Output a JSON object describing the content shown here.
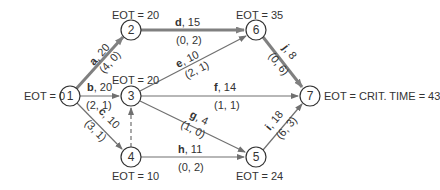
{
  "nodes": [
    {
      "id": "1",
      "eot_label": "EOT = 0"
    },
    {
      "id": "2",
      "eot_label": "EOT = 20"
    },
    {
      "id": "3",
      "eot_label": "EOT = 20"
    },
    {
      "id": "4",
      "eot_label": "EOT = 10"
    },
    {
      "id": "5",
      "eot_label": "EOT = 24"
    },
    {
      "id": "6",
      "eot_label": "EOT = 35"
    },
    {
      "id": "7",
      "eot_label": "EOT = CRIT. TIME = 43"
    }
  ],
  "activities": [
    {
      "name": "a",
      "duration": ", 20",
      "slack": "(4, 0)",
      "from": "1",
      "to": "2",
      "critical": true
    },
    {
      "name": "b",
      "duration": ", 20",
      "slack": "(2, 1)",
      "from": "1",
      "to": "3",
      "critical": false
    },
    {
      "name": "c",
      "duration": ", 10",
      "slack": "(3, 1)",
      "from": "1",
      "to": "4",
      "critical": false
    },
    {
      "name": "d",
      "duration": ", 15",
      "slack": "(0, 2)",
      "from": "2",
      "to": "6",
      "critical": true
    },
    {
      "name": "e",
      "duration": ", 10",
      "slack": "(2, 1)",
      "from": "3",
      "to": "6",
      "critical": false
    },
    {
      "name": "f",
      "duration": ", 14",
      "slack": "(1, 1)",
      "from": "3",
      "to": "7",
      "critical": false
    },
    {
      "name": "g",
      "duration": ", 4",
      "slack": "(1, 0)",
      "from": "3",
      "to": "5",
      "critical": false
    },
    {
      "name": "h",
      "duration": ", 11",
      "slack": "(0, 2)",
      "from": "4",
      "to": "5",
      "critical": false
    },
    {
      "name": "i",
      "duration": ", 18",
      "slack": "(6, 3)",
      "from": "5",
      "to": "7",
      "critical": false
    },
    {
      "name": "j",
      "duration": ", 8",
      "slack": "(0, 6)",
      "from": "6",
      "to": "7",
      "critical": true
    }
  ],
  "dummy": {
    "from": "4",
    "to": "3",
    "style": "dashed"
  },
  "colors": {
    "critical_edge": "#808080",
    "edge": "#707070",
    "node_stroke": "#333333",
    "text": "#333333"
  }
}
